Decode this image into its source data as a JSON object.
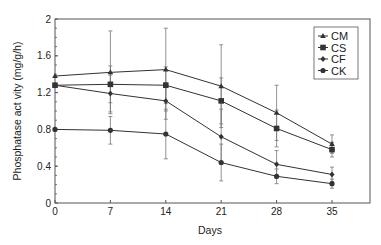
{
  "chart_data": {
    "type": "line",
    "title": "",
    "xlabel": "Days",
    "ylabel": "Phosphatase act vity (mg/g/h)",
    "x": [
      0,
      7,
      14,
      21,
      28,
      35
    ],
    "xticks": [
      "0",
      "7",
      "14",
      "21",
      "28",
      "35"
    ],
    "yticks": [
      "0",
      "0.4",
      "0.8",
      "1.2",
      "1.6",
      "2"
    ],
    "ylim": [
      0,
      2
    ],
    "xlim": [
      0,
      39
    ],
    "grid": false,
    "legend_position": "upper right",
    "series": [
      {
        "name": "CM",
        "marker": "triangle",
        "values": [
          1.38,
          1.42,
          1.45,
          1.27,
          0.98,
          0.64
        ],
        "err": [
          0.0,
          0.45,
          0.45,
          0.45,
          0.3,
          0.1
        ]
      },
      {
        "name": "CS",
        "marker": "square",
        "values": [
          1.28,
          1.29,
          1.28,
          1.11,
          0.81,
          0.58
        ],
        "err": [
          0.0,
          0.2,
          0.2,
          0.25,
          0.2,
          0.08
        ]
      },
      {
        "name": "CF",
        "marker": "diamond",
        "values": [
          1.28,
          1.19,
          1.11,
          0.72,
          0.42,
          0.31
        ],
        "err": [
          0.0,
          0.2,
          0.2,
          0.3,
          0.15,
          0.08
        ]
      },
      {
        "name": "CK",
        "marker": "circle",
        "values": [
          0.8,
          0.79,
          0.75,
          0.44,
          0.29,
          0.21
        ],
        "err": [
          0.0,
          0.15,
          0.27,
          0.2,
          0.08,
          0.05
        ]
      }
    ]
  },
  "colors": {
    "line": "#333333",
    "axis": "#555555",
    "background": "#ffffff"
  }
}
